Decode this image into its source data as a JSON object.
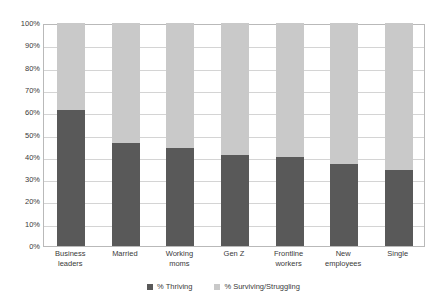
{
  "chart_data": {
    "type": "bar",
    "subtype": "stacked-bar-100",
    "title": "",
    "subtitle": "",
    "xlabel": "",
    "ylabel": "",
    "ylim": [
      0,
      100
    ],
    "grid": true,
    "legend_position": "bottom",
    "categories": [
      "Business leaders",
      "Married",
      "Working moms",
      "Gen Z",
      "Frontline workers",
      "New employees",
      "Single"
    ],
    "category_lines": [
      [
        "Business",
        "leaders"
      ],
      [
        "Married"
      ],
      [
        "Working",
        "moms"
      ],
      [
        "Gen Z"
      ],
      [
        "Frontline",
        "workers"
      ],
      [
        "New",
        "employees"
      ],
      [
        "Single"
      ]
    ],
    "series": [
      {
        "name": "% Thriving",
        "color": "#595959",
        "values": [
          61,
          46,
          44,
          41,
          40,
          37,
          34
        ]
      },
      {
        "name": "% Surviving/Struggling",
        "color": "#c9c9c9",
        "values": [
          39,
          54,
          56,
          59,
          60,
          63,
          66
        ]
      }
    ],
    "y_ticks": [
      0,
      10,
      20,
      30,
      40,
      50,
      60,
      70,
      80,
      90,
      100
    ],
    "y_tick_labels": [
      "0%",
      "10%",
      "20%",
      "30%",
      "40%",
      "50%",
      "60%",
      "70%",
      "80%",
      "90%",
      "100%"
    ]
  },
  "legend": {
    "items": [
      {
        "label": "% Thriving",
        "color": "#595959"
      },
      {
        "label": "% Surviving/Struggling",
        "color": "#c9c9c9"
      }
    ]
  }
}
